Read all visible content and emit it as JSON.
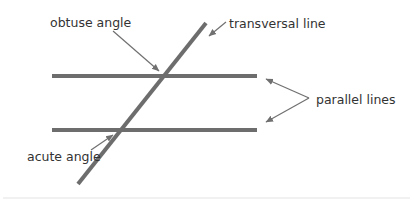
{
  "diagram": {
    "colors": {
      "line": "#6d6d6d",
      "pointer": "#707070",
      "text": "#333333",
      "divider": "#e4e4e4"
    },
    "labels": {
      "obtuse": "obtuse angle",
      "transversal": "transversal line",
      "parallel": "parallel lines",
      "acute": "acute angle"
    },
    "elements": [
      {
        "id": "parallel-line-top",
        "type": "line",
        "role": "parallel line"
      },
      {
        "id": "parallel-line-bottom",
        "type": "line",
        "role": "parallel line"
      },
      {
        "id": "transversal-line",
        "type": "line",
        "role": "transversal"
      }
    ],
    "annotations": [
      {
        "label_key": "obtuse",
        "points_to": "upper intersection (obtuse angle)"
      },
      {
        "label_key": "transversal",
        "points_to": "transversal-line"
      },
      {
        "label_key": "parallel",
        "points_to": [
          "parallel-line-top",
          "parallel-line-bottom"
        ]
      },
      {
        "label_key": "acute",
        "points_to": "lower intersection (acute angle)"
      }
    ]
  }
}
